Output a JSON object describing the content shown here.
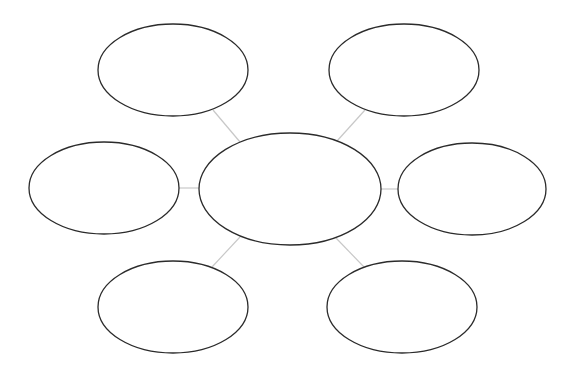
{
  "diagram": {
    "type": "bubble-map",
    "colors": {
      "background": "#ffffff",
      "node_stroke": "#2b2b2b",
      "connector": "#c8c8c8"
    },
    "center": {
      "id": "center",
      "label": "",
      "cx": 290,
      "cy": 189,
      "rx": 91,
      "ry": 56
    },
    "nodes": [
      {
        "id": "top-left",
        "label": "",
        "cx": 173,
        "cy": 70,
        "rx": 75,
        "ry": 46
      },
      {
        "id": "top-right",
        "label": "",
        "cx": 404,
        "cy": 70,
        "rx": 75,
        "ry": 46
      },
      {
        "id": "left",
        "label": "",
        "cx": 104,
        "cy": 188,
        "rx": 75,
        "ry": 46
      },
      {
        "id": "right",
        "label": "",
        "cx": 472,
        "cy": 189,
        "rx": 74,
        "ry": 46
      },
      {
        "id": "bottom-left",
        "label": "",
        "cx": 173,
        "cy": 307,
        "rx": 75,
        "ry": 46
      },
      {
        "id": "bottom-right",
        "label": "",
        "cx": 402,
        "cy": 307,
        "rx": 75,
        "ry": 46
      }
    ],
    "connectors": [
      {
        "from": "center",
        "to": "top-left",
        "x1": 240,
        "y1": 142,
        "x2": 213,
        "y2": 110
      },
      {
        "from": "center",
        "to": "top-right",
        "x1": 337,
        "y1": 141,
        "x2": 365,
        "y2": 110
      },
      {
        "from": "center",
        "to": "left",
        "x1": 199,
        "y1": 188,
        "x2": 179,
        "y2": 188
      },
      {
        "from": "center",
        "to": "right",
        "x1": 380,
        "y1": 189,
        "x2": 398,
        "y2": 189
      },
      {
        "from": "center",
        "to": "bottom-left",
        "x1": 240,
        "y1": 237,
        "x2": 212,
        "y2": 267
      },
      {
        "from": "center",
        "to": "bottom-right",
        "x1": 336,
        "y1": 238,
        "x2": 364,
        "y2": 267
      }
    ]
  }
}
